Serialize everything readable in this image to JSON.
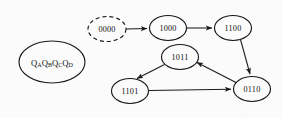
{
  "diagram": {
    "background_color": "#fbfbfb",
    "stroke_color": "#1a1a1a",
    "register_label": {
      "parts": [
        "Q",
        "A",
        "Q",
        "B",
        "Q",
        "C",
        "Q",
        "D"
      ],
      "text": "QAQBQCQD",
      "q": "Q",
      "sub_a": "A",
      "sub_b": "B",
      "sub_c": "C",
      "sub_d": "D"
    },
    "nodes": [
      {
        "id": "register",
        "label": "QAQBQCQD",
        "cx": 52,
        "cy": 62,
        "rx": 33,
        "ry": 21,
        "style": "solid"
      },
      {
        "id": "n0000",
        "label": "0000",
        "cx": 107,
        "cy": 29,
        "rx": 19,
        "ry": 12.5,
        "style": "dashed"
      },
      {
        "id": "n1000",
        "label": "1000",
        "cx": 168,
        "cy": 28,
        "rx": 18.5,
        "ry": 12.5,
        "style": "solid"
      },
      {
        "id": "n1100",
        "label": "1100",
        "cx": 233,
        "cy": 28,
        "rx": 18.5,
        "ry": 12.5,
        "style": "solid"
      },
      {
        "id": "n1011",
        "label": "1011",
        "cx": 180,
        "cy": 57,
        "rx": 18.5,
        "ry": 12.5,
        "style": "solid"
      },
      {
        "id": "n1101",
        "label": "1101",
        "cx": 130,
        "cy": 91,
        "rx": 18.5,
        "ry": 12.5,
        "style": "solid"
      },
      {
        "id": "n0110",
        "label": "0110",
        "cx": 252,
        "cy": 89,
        "rx": 18.5,
        "ry": 12.5,
        "style": "solid"
      }
    ],
    "edges": [
      {
        "id": "e-0000-1000",
        "from": "0000",
        "to": "1000",
        "x1": 126,
        "y1": 29,
        "x2": 148,
        "y2": 28.5
      },
      {
        "id": "e-1000-1100",
        "from": "1000",
        "to": "1100",
        "x1": 187,
        "y1": 28,
        "x2": 213,
        "y2": 28
      },
      {
        "id": "e-1100-0110",
        "from": "1100",
        "to": "0110",
        "x1": 240,
        "y1": 40,
        "x2": 251,
        "y2": 75
      },
      {
        "id": "e-0110-1011",
        "from": "0110",
        "to": "1011",
        "x1": 235,
        "y1": 82,
        "x2": 198,
        "y2": 63
      },
      {
        "id": "e-1011-1101",
        "from": "1011",
        "to": "1101",
        "x1": 164,
        "y1": 65,
        "x2": 136,
        "y2": 79
      },
      {
        "id": "e-1101-0110",
        "from": "1101",
        "to": "0110",
        "x1": 149,
        "y1": 91,
        "x2": 232,
        "y2": 89
      }
    ]
  }
}
